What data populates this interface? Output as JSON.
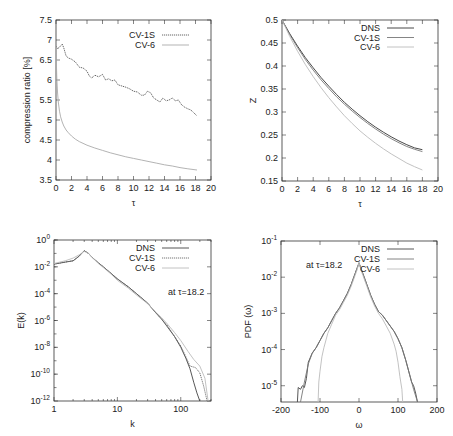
{
  "figure": {
    "width": 453,
    "height": 436,
    "header_text": ""
  },
  "chart_data": [
    {
      "id": "compression",
      "type": "line",
      "title": "",
      "xlabel": "τ",
      "ylabel": "compression ratio [%]",
      "xlim": [
        0,
        20
      ],
      "ylim": [
        3.5,
        7.5
      ],
      "xticks": [
        0,
        2,
        4,
        6,
        8,
        10,
        12,
        14,
        16,
        18,
        20
      ],
      "yticks": [
        3.5,
        4,
        4.5,
        5,
        5.5,
        6,
        6.5,
        7,
        7.5
      ],
      "ytick_labels": [
        "3.5",
        "4",
        "4.5",
        "5",
        "5.5",
        "6",
        "6.5",
        "7",
        "7.5"
      ],
      "grid": false,
      "legend_position": "upper right",
      "series": [
        {
          "name": "CV-1S",
          "color": "#555555",
          "width": 0.9,
          "dash": "1.2,0.8",
          "x": [
            0,
            0.2,
            0.5,
            0.8,
            1.0,
            1.3,
            1.6,
            2.0,
            2.5,
            3.0,
            3.5,
            4.0,
            4.3,
            4.6,
            5.0,
            5.5,
            6.0,
            6.4,
            6.8,
            7.2,
            7.6,
            8.0,
            8.5,
            9.0,
            9.5,
            10.0,
            10.5,
            11.0,
            11.4,
            11.8,
            12.2,
            12.6,
            13.0,
            13.4,
            13.8,
            14.2,
            14.6,
            15.0,
            15.4,
            15.8,
            16.2,
            16.6,
            17.0,
            17.4,
            17.8,
            18.2
          ],
          "y": [
            6.85,
            6.78,
            6.83,
            6.9,
            6.8,
            6.6,
            6.55,
            6.52,
            6.45,
            6.32,
            6.3,
            6.22,
            6.1,
            6.05,
            6.12,
            6.08,
            6.14,
            6.0,
            6.03,
            5.98,
            6.0,
            5.88,
            5.85,
            5.82,
            5.78,
            5.72,
            5.7,
            5.62,
            5.62,
            5.72,
            5.68,
            5.55,
            5.5,
            5.45,
            5.55,
            5.48,
            5.5,
            5.55,
            5.48,
            5.5,
            5.38,
            5.32,
            5.28,
            5.25,
            5.18,
            5.1
          ]
        },
        {
          "name": "CV-6",
          "color": "#aaaaaa",
          "width": 0.9,
          "dash": "",
          "x": [
            0,
            0.05,
            0.1,
            0.2,
            0.3,
            0.45,
            0.6,
            0.8,
            1.0,
            1.3,
            1.6,
            2.0,
            2.5,
            3.0,
            4.0,
            5.0,
            6.0,
            7.0,
            8.0,
            9.0,
            10.0,
            11.0,
            12.0,
            13.0,
            14.0,
            15.0,
            16.0,
            17.0,
            18.2
          ],
          "y": [
            6.9,
            6.4,
            6.05,
            5.7,
            5.45,
            5.22,
            5.08,
            4.95,
            4.85,
            4.75,
            4.68,
            4.6,
            4.52,
            4.46,
            4.37,
            4.3,
            4.24,
            4.18,
            4.13,
            4.08,
            4.04,
            4.0,
            3.96,
            3.92,
            3.88,
            3.85,
            3.81,
            3.78,
            3.75
          ]
        }
      ]
    },
    {
      "id": "z",
      "type": "line",
      "title": "",
      "xlabel": "τ",
      "ylabel": "Z",
      "xlim": [
        0,
        20
      ],
      "ylim": [
        0.15,
        0.5
      ],
      "xticks": [
        0,
        2,
        4,
        6,
        8,
        10,
        12,
        14,
        16,
        18,
        20
      ],
      "yticks": [
        0.15,
        0.2,
        0.25,
        0.3,
        0.35,
        0.4,
        0.45,
        0.5
      ],
      "ytick_labels": [
        "0.15",
        "0.2",
        "0.25",
        "0.3",
        "0.35",
        "0.4",
        "0.45",
        "0.5"
      ],
      "grid": false,
      "legend_position": "upper right",
      "series": [
        {
          "name": "DNS",
          "color": "#333333",
          "width": 0.9,
          "dash": "",
          "x": [
            0,
            1,
            2,
            3,
            4,
            5,
            6,
            7,
            8,
            9,
            10,
            11,
            12,
            13,
            14,
            15,
            16,
            17,
            18
          ],
          "y": [
            0.5,
            0.47,
            0.443,
            0.418,
            0.396,
            0.375,
            0.356,
            0.338,
            0.321,
            0.306,
            0.292,
            0.279,
            0.267,
            0.256,
            0.246,
            0.237,
            0.229,
            0.222,
            0.218
          ]
        },
        {
          "name": "CV-1S",
          "color": "#777777",
          "width": 0.9,
          "dash": "",
          "x": [
            0,
            1,
            2,
            3,
            4,
            5,
            6,
            7,
            8,
            9,
            10,
            11,
            12,
            13,
            14,
            15,
            16,
            17,
            18
          ],
          "y": [
            0.5,
            0.468,
            0.44,
            0.414,
            0.391,
            0.37,
            0.351,
            0.333,
            0.317,
            0.302,
            0.288,
            0.275,
            0.263,
            0.252,
            0.242,
            0.233,
            0.225,
            0.219,
            0.214
          ]
        },
        {
          "name": "CV-6",
          "color": "#bbbbbb",
          "width": 0.9,
          "dash": "",
          "x": [
            0,
            1,
            2,
            3,
            4,
            5,
            6,
            7,
            8,
            9,
            10,
            11,
            12,
            13,
            14,
            15,
            16,
            17,
            18
          ],
          "y": [
            0.5,
            0.464,
            0.432,
            0.403,
            0.377,
            0.353,
            0.331,
            0.311,
            0.292,
            0.275,
            0.259,
            0.245,
            0.232,
            0.22,
            0.209,
            0.199,
            0.189,
            0.181,
            0.174
          ]
        }
      ]
    },
    {
      "id": "spectrum",
      "type": "line",
      "title": "",
      "xlabel": "k",
      "ylabel": "E(k)",
      "xscale": "log",
      "yscale": "log",
      "xlim": [
        1,
        300
      ],
      "ylim_log10": [
        -12,
        0
      ],
      "xticks": [
        1,
        10,
        100
      ],
      "xtick_labels": [
        "1",
        "10",
        "100"
      ],
      "yticks_log10": [
        0,
        -2,
        -4,
        -6,
        -8,
        -10,
        -12
      ],
      "ytick_labels": [
        "10^0",
        "10^-2",
        "10^-4",
        "10^-6",
        "10^-8",
        "10^-10",
        "10^-12"
      ],
      "grid": false,
      "legend_position": "upper right",
      "annotation": "at τ=18.2",
      "series": [
        {
          "name": "DNS",
          "color": "#444444",
          "width": 0.9,
          "dash": "",
          "k": [
            1,
            1.5,
            2,
            2.5,
            3,
            3.5,
            4,
            5,
            6,
            8,
            10,
            15,
            20,
            30,
            40,
            50,
            60,
            80,
            100,
            120,
            140,
            160,
            180,
            200
          ],
          "log10E": [
            -1.8,
            -1.65,
            -1.55,
            -1.2,
            -0.8,
            -1.0,
            -1.3,
            -1.7,
            -2.0,
            -2.5,
            -2.9,
            -3.5,
            -4.0,
            -4.7,
            -5.4,
            -5.9,
            -6.4,
            -7.2,
            -8.0,
            -8.8,
            -9.6,
            -10.6,
            -11.4,
            -12.0
          ]
        },
        {
          "name": "CV-1S",
          "color": "#666666",
          "width": 0.9,
          "dash": "1.2,0.8",
          "k": [
            1,
            1.5,
            2,
            2.5,
            3,
            3.5,
            4,
            5,
            6,
            8,
            10,
            15,
            20,
            30,
            40,
            50,
            60,
            80,
            100,
            120,
            140,
            170,
            200,
            230,
            260
          ],
          "log10E": [
            -1.8,
            -1.65,
            -1.55,
            -1.2,
            -0.8,
            -1.0,
            -1.3,
            -1.7,
            -2.0,
            -2.5,
            -2.9,
            -3.5,
            -4.0,
            -4.7,
            -5.4,
            -5.9,
            -6.3,
            -7.2,
            -7.9,
            -8.7,
            -9.4,
            -9.5,
            -9.9,
            -10.9,
            -12.0
          ]
        },
        {
          "name": "CV-6",
          "color": "#bbbbbb",
          "width": 0.9,
          "dash": "",
          "k": [
            1,
            1.5,
            2,
            2.5,
            3,
            3.5,
            4,
            5,
            6,
            8,
            10,
            15,
            20,
            30,
            40,
            50,
            60,
            80,
            100,
            130,
            160,
            200,
            240,
            270
          ],
          "log10E": [
            -1.75,
            -1.55,
            -1.35,
            -1.1,
            -0.85,
            -1.0,
            -1.3,
            -1.75,
            -2.05,
            -2.55,
            -3.0,
            -3.6,
            -4.1,
            -4.75,
            -5.35,
            -5.8,
            -6.2,
            -6.9,
            -7.5,
            -8.3,
            -8.9,
            -9.4,
            -10.3,
            -12.0
          ]
        }
      ]
    },
    {
      "id": "pdf",
      "type": "line",
      "title": "",
      "xlabel": "ω",
      "ylabel": "PDF (ω)",
      "yscale": "log",
      "xlim": [
        -200,
        200
      ],
      "ylim_log10": [
        -5.45,
        -1
      ],
      "xticks": [
        -200,
        -100,
        0,
        100,
        200
      ],
      "xtick_labels": [
        "-200",
        "-100",
        "0",
        "100",
        "200"
      ],
      "yticks_log10": [
        -1,
        -2,
        -3,
        -4,
        -5
      ],
      "ytick_labels": [
        "10^-1",
        "10^-2",
        "10^-3",
        "10^-4",
        "10^-5"
      ],
      "grid": false,
      "legend_position": "upper right",
      "annotation": "at τ=18.2",
      "series": [
        {
          "name": "DNS",
          "color": "#444444",
          "width": 0.9,
          "dash": "",
          "w": [
            -158,
            -156,
            -150,
            -145,
            -140,
            -135,
            -130,
            -120,
            -110,
            -100,
            -90,
            -80,
            -70,
            -60,
            -50,
            -40,
            -30,
            -20,
            -10,
            -5,
            0,
            5,
            10,
            20,
            30,
            40,
            50,
            60,
            70,
            80,
            90,
            100,
            110,
            120,
            130,
            135,
            140,
            145,
            150
          ],
          "log10P": [
            -5.45,
            -5.05,
            -5.1,
            -5.0,
            -5.05,
            -4.8,
            -4.35,
            -4.1,
            -3.95,
            -3.75,
            -3.55,
            -3.4,
            -3.2,
            -3.0,
            -2.85,
            -2.65,
            -2.45,
            -2.2,
            -1.9,
            -1.75,
            -1.6,
            -1.75,
            -1.9,
            -2.2,
            -2.5,
            -2.75,
            -2.95,
            -3.05,
            -3.2,
            -3.35,
            -3.5,
            -3.7,
            -3.95,
            -4.3,
            -4.7,
            -4.9,
            -5.0,
            -5.2,
            -5.45
          ]
        },
        {
          "name": "CV-1S",
          "color": "#777777",
          "width": 0.9,
          "dash": "",
          "w": [
            -150,
            -140,
            -130,
            -120,
            -110,
            -100,
            -90,
            -80,
            -70,
            -60,
            -50,
            -40,
            -30,
            -20,
            -10,
            -5,
            0,
            5,
            10,
            20,
            30,
            40,
            50,
            60,
            70,
            80,
            90,
            100,
            110,
            120,
            130,
            140,
            150
          ],
          "log10P": [
            -5.45,
            -4.9,
            -4.4,
            -4.1,
            -3.95,
            -3.75,
            -3.55,
            -3.4,
            -3.2,
            -3.0,
            -2.85,
            -2.65,
            -2.45,
            -2.2,
            -1.9,
            -1.75,
            -1.62,
            -1.75,
            -1.9,
            -2.2,
            -2.5,
            -2.75,
            -2.95,
            -3.05,
            -3.2,
            -3.35,
            -3.5,
            -3.7,
            -3.95,
            -4.3,
            -4.7,
            -5.1,
            -5.45
          ]
        },
        {
          "name": "CV-6",
          "color": "#bbbbbb",
          "width": 0.9,
          "dash": "",
          "w": [
            -105,
            -103,
            -100,
            -95,
            -90,
            -80,
            -70,
            -60,
            -50,
            -40,
            -30,
            -20,
            -10,
            -5,
            0,
            5,
            10,
            20,
            30,
            40,
            50,
            60,
            70,
            80,
            90,
            95,
            100,
            105,
            110,
            112
          ],
          "log10P": [
            -5.45,
            -4.9,
            -4.6,
            -4.2,
            -3.95,
            -3.55,
            -3.3,
            -3.05,
            -2.9,
            -2.7,
            -2.5,
            -2.25,
            -1.95,
            -1.8,
            -1.6,
            -1.8,
            -1.95,
            -2.25,
            -2.55,
            -2.8,
            -3.0,
            -3.15,
            -3.35,
            -3.55,
            -3.85,
            -4.05,
            -4.35,
            -4.75,
            -5.1,
            -5.45
          ]
        }
      ]
    }
  ]
}
